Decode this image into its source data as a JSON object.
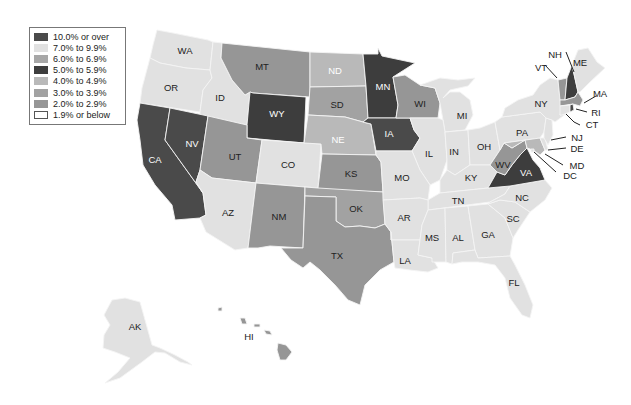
{
  "legend": {
    "items": [
      {
        "label": "10.0% or over",
        "color": "#4a4a4a"
      },
      {
        "label": "7.0% to 9.9%",
        "color": "#e1e1e1"
      },
      {
        "label": "6.0% to 6.9%",
        "color": "#a7a7a7"
      },
      {
        "label": "5.0% to 5.9%",
        "color": "#3d3d3d"
      },
      {
        "label": "4.0% to 4.9%",
        "color": "#b9b9b9"
      },
      {
        "label": "3.0% to 3.9%",
        "color": "#a2a2a2"
      },
      {
        "label": "2.0% to 2.9%",
        "color": "#969696"
      },
      {
        "label": "1.9% or below",
        "color": "#ffffff"
      }
    ]
  },
  "states": {
    "WA": {
      "label": "WA",
      "category": "7.0% to 9.9%"
    },
    "OR": {
      "label": "OR",
      "category": "7.0% to 9.9%"
    },
    "CA": {
      "label": "CA",
      "category": "10.0% or over"
    },
    "NV": {
      "label": "NV",
      "category": "10.0% or over"
    },
    "ID": {
      "label": "ID",
      "category": "7.0% to 9.9%"
    },
    "MT": {
      "label": "MT",
      "category": "2.0% to 2.9%"
    },
    "WY": {
      "label": "WY",
      "category": "5.0% to 5.9%"
    },
    "UT": {
      "label": "UT",
      "category": "2.0% to 2.9%"
    },
    "CO": {
      "label": "CO",
      "category": "7.0% to 9.9%"
    },
    "AZ": {
      "label": "AZ",
      "category": "7.0% to 9.9%"
    },
    "NM": {
      "label": "NM",
      "category": "2.0% to 2.9%"
    },
    "ND": {
      "label": "ND",
      "category": "4.0% to 4.9%"
    },
    "SD": {
      "label": "SD",
      "category": "3.0% to 3.9%"
    },
    "NE": {
      "label": "NE",
      "category": "4.0% to 4.9%"
    },
    "KS": {
      "label": "KS",
      "category": "2.0% to 2.9%"
    },
    "OK": {
      "label": "OK",
      "category": "3.0% to 3.9%"
    },
    "TX": {
      "label": "TX",
      "category": "2.0% to 2.9%"
    },
    "MN": {
      "label": "MN",
      "category": "5.0% to 5.9%"
    },
    "IA": {
      "label": "IA",
      "category": "10.0% or over"
    },
    "MO": {
      "label": "MO",
      "category": "7.0% to 9.9%"
    },
    "AR": {
      "label": "AR",
      "category": "7.0% to 9.9%"
    },
    "LA": {
      "label": "LA",
      "category": "7.0% to 9.9%"
    },
    "WI": {
      "label": "WI",
      "category": "2.0% to 2.9%"
    },
    "IL": {
      "label": "IL",
      "category": "7.0% to 9.9%"
    },
    "MI": {
      "label": "MI",
      "category": "7.0% to 9.9%"
    },
    "IN": {
      "label": "IN",
      "category": "7.0% to 9.9%"
    },
    "OH": {
      "label": "OH",
      "category": "7.0% to 9.9%"
    },
    "KY": {
      "label": "KY",
      "category": "7.0% to 9.9%"
    },
    "TN": {
      "label": "TN",
      "category": "7.0% to 9.9%"
    },
    "MS": {
      "label": "MS",
      "category": "7.0% to 9.9%"
    },
    "AL": {
      "label": "AL",
      "category": "7.0% to 9.9%"
    },
    "GA": {
      "label": "GA",
      "category": "7.0% to 9.9%"
    },
    "FL": {
      "label": "FL",
      "category": "7.0% to 9.9%"
    },
    "SC": {
      "label": "SC",
      "category": "7.0% to 9.9%"
    },
    "NC": {
      "label": "NC",
      "category": "7.0% to 9.9%"
    },
    "VA": {
      "label": "VA",
      "category": "5.0% to 5.9%"
    },
    "WV": {
      "label": "WV",
      "category": "2.0% to 2.9%"
    },
    "PA": {
      "label": "PA",
      "category": "7.0% to 9.9%"
    },
    "NY": {
      "label": "NY",
      "category": "7.0% to 9.9%"
    },
    "VT": {
      "label": "VT",
      "category": "2.0% to 2.9%"
    },
    "NH": {
      "label": "NH",
      "category": "5.0% to 5.9%"
    },
    "ME": {
      "label": "ME",
      "category": "7.0% to 9.9%"
    },
    "MA": {
      "label": "MA",
      "category": "2.0% to 2.9%"
    },
    "RI": {
      "label": "RI",
      "category": "10.0% or over"
    },
    "CT": {
      "label": "CT",
      "category": "7.0% to 9.9%"
    },
    "NJ": {
      "label": "NJ",
      "category": "7.0% to 9.9%"
    },
    "DE": {
      "label": "DE",
      "category": "7.0% to 9.9%"
    },
    "MD": {
      "label": "MD",
      "category": "4.0% to 4.9%"
    },
    "DC": {
      "label": "DC",
      "category": "7.0% to 9.9%"
    },
    "AK": {
      "label": "AK",
      "category": "7.0% to 9.9%"
    },
    "HI": {
      "label": "HI",
      "category": "2.0% to 2.9%"
    }
  }
}
